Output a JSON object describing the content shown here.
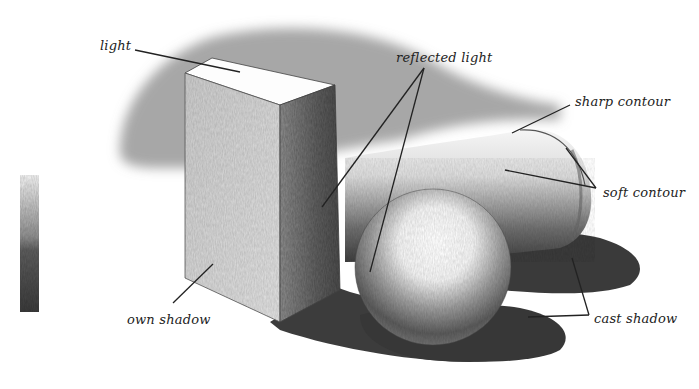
{
  "figure": {
    "background": "#ffffff",
    "ink": "#222222",
    "labels": [
      {
        "id": "light",
        "text": "light",
        "x": 100,
        "y": 40
      },
      {
        "id": "reflected-light",
        "text": "reflected light",
        "x": 396,
        "y": 52
      },
      {
        "id": "sharp-contour",
        "text": "sharp contour",
        "x": 575,
        "y": 96
      },
      {
        "id": "soft-contour",
        "text": "soft contour",
        "x": 603,
        "y": 187
      },
      {
        "id": "own-shadow",
        "text": "own shadow",
        "x": 127,
        "y": 314
      },
      {
        "id": "cast-shadow",
        "text": "cast shadow",
        "x": 594,
        "y": 313
      }
    ],
    "leader_lines": [
      {
        "label": "light",
        "x1": 135,
        "y1": 50,
        "x2": 240,
        "y2": 72
      },
      {
        "label": "reflected light",
        "x1": 424,
        "y1": 68,
        "x2": 322,
        "y2": 207
      },
      {
        "label": "reflected light",
        "x1": 424,
        "y1": 68,
        "x2": 370,
        "y2": 272
      },
      {
        "label": "sharp contour",
        "x1": 570,
        "y1": 105,
        "x2": 512,
        "y2": 133
      },
      {
        "label": "soft contour",
        "x1": 596,
        "y1": 188,
        "x2": 566,
        "y2": 148
      },
      {
        "label": "soft contour",
        "x1": 596,
        "y1": 188,
        "x2": 505,
        "y2": 170
      },
      {
        "label": "own shadow",
        "x1": 173,
        "y1": 303,
        "x2": 213,
        "y2": 264
      },
      {
        "label": "cast shadow",
        "x1": 589,
        "y1": 315,
        "x2": 572,
        "y2": 258
      },
      {
        "label": "cast shadow",
        "x1": 589,
        "y1": 315,
        "x2": 528,
        "y2": 317
      }
    ],
    "value_scale": {
      "x": 20,
      "y": 175,
      "width": 19,
      "height": 137,
      "steps": [
        "#e6e6e6",
        "#c8c8c8",
        "#9a9a9a",
        "#6a6a6a",
        "#4a4a4a",
        "#333333"
      ]
    }
  }
}
